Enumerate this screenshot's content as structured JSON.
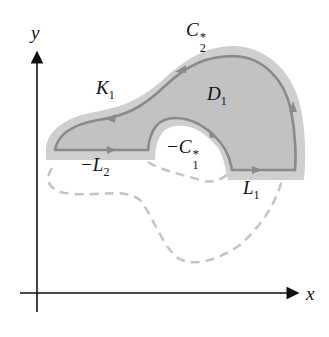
{
  "diagram": {
    "axes": {
      "x_label": "x",
      "y_label": "y"
    },
    "labels": {
      "K1": {
        "base": "K",
        "sub": "1"
      },
      "C2": {
        "base": "C",
        "sub": "2",
        "sup": "*"
      },
      "D1": {
        "base": "D",
        "sub": "1"
      },
      "C1": {
        "prefix": "−",
        "base": "C",
        "sub": "1",
        "sup": "*"
      },
      "L2": {
        "prefix": "−",
        "base": "L",
        "sub": "2"
      },
      "L1": {
        "base": "L",
        "sub": "1"
      }
    },
    "colors": {
      "region_fill": "#c8c8c8",
      "boundary": "#8a8a8a",
      "dashed": "#c4c4c4",
      "axis": "#111111"
    }
  }
}
